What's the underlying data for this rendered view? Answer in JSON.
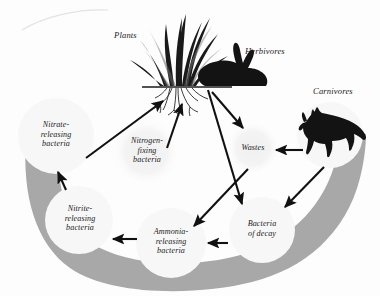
{
  "figure": {
    "background_color": "#fdfdfd",
    "band_color": "#a8a8a8",
    "circle_color": "#f7f7f7",
    "faint_circle_color": "#f2f2f2",
    "arrow_color": "#111111",
    "silhouette_color": "#111111"
  },
  "nodes": [
    {
      "id": "nitrate-releasing-bacteria",
      "label": "Nitrate-\nreleasing\nbacteria",
      "cx": 56,
      "cy": 136,
      "r": 38,
      "style": "solid"
    },
    {
      "id": "nitrogen-fixing-bacteria",
      "label": "Nitrogen-\nfixing\nbacteria",
      "cx": 146,
      "cy": 152,
      "r": 33,
      "style": "faint"
    },
    {
      "id": "wastes",
      "label": "Wastes",
      "cx": 253,
      "cy": 148,
      "r": 26,
      "style": "faint"
    },
    {
      "id": "carnivores-circle",
      "label": "",
      "cx": 330,
      "cy": 135,
      "r": 33,
      "style": "solid"
    },
    {
      "id": "nitrite-releasing-bacteria",
      "label": "Nitrite-\nreleasing\nbacteria",
      "cx": 79,
      "cy": 220,
      "r": 34,
      "style": "solid"
    },
    {
      "id": "ammonia-releasing-bacteria",
      "label": "Ammonia-\nreleasing\nbacteria",
      "cx": 171,
      "cy": 243,
      "r": 35,
      "style": "solid"
    },
    {
      "id": "bacteria-of-decay",
      "label": "Bacteria\nof decay",
      "cx": 262,
      "cy": 230,
      "r": 33,
      "style": "solid"
    }
  ],
  "free_labels": [
    {
      "id": "plants",
      "text": "Plants",
      "x": 114,
      "y": 36
    },
    {
      "id": "herbivores",
      "text": "Herbivores",
      "x": 245,
      "y": 52
    },
    {
      "id": "carnivores",
      "text": "Carnivores",
      "x": 313,
      "y": 92
    }
  ],
  "organisms": [
    {
      "id": "plants-silhouette",
      "name": "grass-with-roots"
    },
    {
      "id": "herbivore-silhouette",
      "name": "rabbit"
    },
    {
      "id": "carnivore-silhouette",
      "name": "fox"
    }
  ],
  "arrows": [
    {
      "id": "nitrate-to-plants",
      "from": "nitrate-releasing-bacteria",
      "to": "plants"
    },
    {
      "id": "nitrogen-fixing-to-plants",
      "from": "nitrogen-fixing-bacteria",
      "to": "plants"
    },
    {
      "id": "plants-to-wastes",
      "from": "plants",
      "to": "wastes"
    },
    {
      "id": "herbivore-to-decay",
      "from": "herbivores",
      "to": "bacteria-of-decay"
    },
    {
      "id": "wastes-to-ammonia",
      "from": "wastes",
      "to": "ammonia-releasing-bacteria"
    },
    {
      "id": "carnivores-to-wastes",
      "from": "carnivores",
      "to": "wastes"
    },
    {
      "id": "carnivores-to-decay",
      "from": "carnivores",
      "to": "bacteria-of-decay"
    },
    {
      "id": "decay-to-ammonia",
      "from": "bacteria-of-decay",
      "to": "ammonia-releasing-bacteria"
    },
    {
      "id": "ammonia-to-nitrite",
      "from": "ammonia-releasing-bacteria",
      "to": "nitrite-releasing-bacteria"
    },
    {
      "id": "nitrite-to-nitrate",
      "from": "nitrite-releasing-bacteria",
      "to": "nitrate-releasing-bacteria"
    }
  ]
}
